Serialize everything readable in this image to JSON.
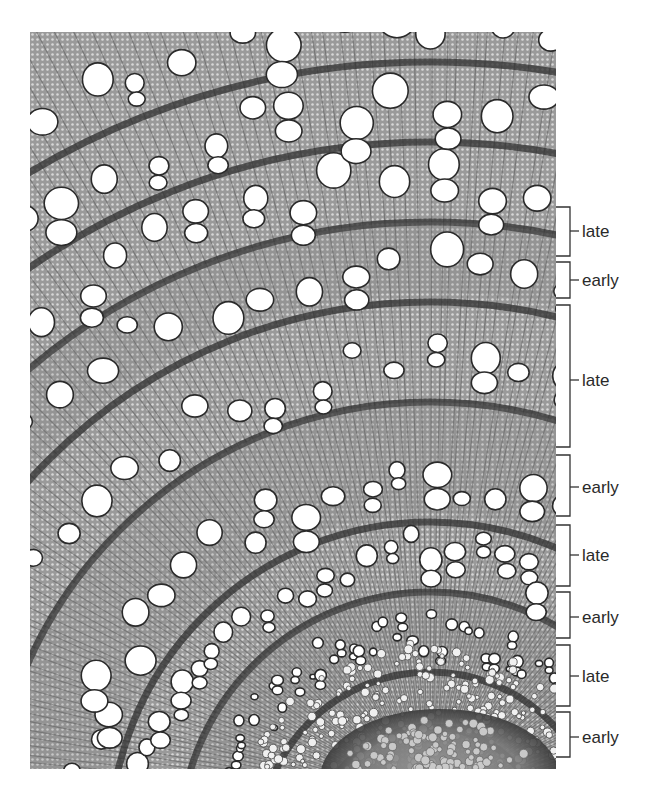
{
  "figure": {
    "image_region": {
      "x": 30,
      "y": 32,
      "width": 526,
      "height": 737
    },
    "colors": {
      "background": "#ffffff",
      "tissue": "#8c8c8c",
      "tissue_light": "#b4b4b4",
      "tissue_dark": "#2e2e2e",
      "vessel": "#ffffff",
      "bracket": "#333333",
      "label": "#2a2a2a"
    }
  },
  "annotations": {
    "bracket_x": 570,
    "tick_left_x": 556,
    "tick_right_x": 579,
    "label_x": 582,
    "bands": [
      {
        "label": "late",
        "top": 207,
        "bottom": 256,
        "mid": 231
      },
      {
        "label": "early",
        "top": 262,
        "bottom": 298,
        "mid": 280
      },
      {
        "label": "late",
        "top": 305,
        "bottom": 447,
        "mid": 380
      },
      {
        "label": "early",
        "top": 455,
        "bottom": 516,
        "mid": 487
      },
      {
        "label": "late",
        "top": 525,
        "bottom": 586,
        "mid": 555
      },
      {
        "label": "early",
        "top": 592,
        "bottom": 638,
        "mid": 617
      },
      {
        "label": "late",
        "top": 645,
        "bottom": 706,
        "mid": 676
      },
      {
        "label": "early",
        "top": 712,
        "bottom": 757,
        "mid": 737
      }
    ]
  }
}
